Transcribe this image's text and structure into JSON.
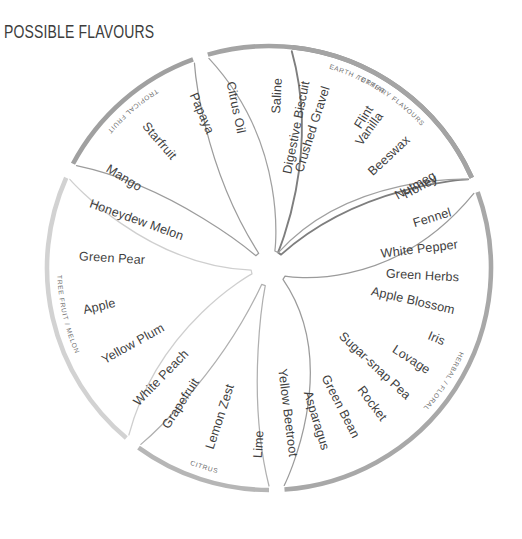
{
  "title": "POSSIBLE FLAVOURS",
  "wheel": {
    "center": {
      "x": 269,
      "y": 268
    },
    "rim_radius": 222,
    "sections": [
      {
        "id": "tertiary-flavours",
        "label": "TERTIARY FLAVOURS",
        "rim_color": "#8f8f8f",
        "petal_color": "#7e7e7e",
        "start_angle": -84,
        "end_angle": -24,
        "items": [
          "Digestive Biscuit",
          "Vanilla",
          "Nutmeg"
        ]
      },
      {
        "id": "herbal-floral",
        "label": "HERBAL / FLORAL",
        "rim_color": "#a8a8a8",
        "petal_color": "#9b9b9b",
        "start_angle": -20,
        "end_angle": 86,
        "items": [
          "Fennel",
          "White Pepper",
          "Green Herbs",
          "Apple Blossom",
          "Iris",
          "Lovage",
          "Sugar-snap Pea",
          "Rocket",
          "Green Bean",
          "Asparagus",
          "Yellow Beetroot"
        ]
      },
      {
        "id": "citrus",
        "label": "CITRUS",
        "rim_color": "#b6b6b6",
        "petal_color": "#b0b0b0",
        "start_angle": 90,
        "end_angle": 126,
        "items": [
          "Lime",
          "Lemon Zest",
          "Grapefruit"
        ]
      },
      {
        "id": "tree-fruit-melon",
        "label": "TREE FRUIT / MELON",
        "rim_color": "#d2d2d2",
        "petal_color": "#cfcfcf",
        "start_angle": 130,
        "end_angle": 204,
        "items": [
          "White Peach",
          "Yellow Plum",
          "Apple",
          "Green Pear",
          "Honeydew Melon"
        ]
      },
      {
        "id": "tropical-fruit",
        "label": "TROPICAL FRUIT",
        "rim_color": "#a0a0a0",
        "petal_color": "#9c9c9c",
        "start_angle": 208,
        "end_angle": 250,
        "items": [
          "Mango",
          "Starfruit",
          "Papaya"
        ]
      },
      {
        "id": "earth-other",
        "label": "EARTH / OTHER",
        "rim_color": "#a4a4a4",
        "petal_color": "#a0a0a0",
        "start_angle": 254,
        "end_angle": 336,
        "items": [
          "Citrus Oil",
          "Saline",
          "Crushed Gravel",
          "Flint",
          "Beeswax",
          "Honey"
        ]
      }
    ]
  }
}
